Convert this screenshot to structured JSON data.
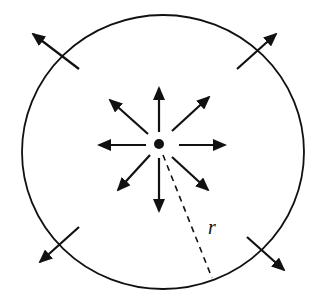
{
  "diagram": {
    "radius_label": "r",
    "colors": {
      "stroke": "#111111",
      "background": "#ffffff"
    },
    "circle": {
      "cx": 163,
      "cy": 152,
      "rx": 141,
      "ry": 137
    },
    "source": {
      "cx": 159,
      "cy": 144,
      "r": 5
    },
    "inner_arrows": [
      {
        "x1": 159,
        "y1": 132,
        "x2": 159,
        "y2": 88
      },
      {
        "x1": 172,
        "y1": 131,
        "x2": 209,
        "y2": 97
      },
      {
        "x1": 179,
        "y1": 145,
        "x2": 225,
        "y2": 145
      },
      {
        "x1": 172,
        "y1": 157,
        "x2": 208,
        "y2": 190
      },
      {
        "x1": 159,
        "y1": 158,
        "x2": 159,
        "y2": 211
      },
      {
        "x1": 150,
        "y1": 155,
        "x2": 118,
        "y2": 190
      },
      {
        "x1": 146,
        "y1": 145,
        "x2": 99,
        "y2": 145
      },
      {
        "x1": 148,
        "y1": 134,
        "x2": 110,
        "y2": 100
      }
    ],
    "outer_arrows": [
      {
        "x1": 79,
        "y1": 69,
        "x2": 33,
        "y2": 34
      },
      {
        "x1": 237,
        "y1": 69,
        "x2": 276,
        "y2": 34
      },
      {
        "x1": 79,
        "y1": 227,
        "x2": 40,
        "y2": 262
      },
      {
        "x1": 247,
        "y1": 237,
        "x2": 284,
        "y2": 270
      }
    ],
    "radius_line": {
      "x1": 163,
      "y1": 155,
      "x2": 212,
      "y2": 278
    },
    "radius_label_pos": {
      "x": 208,
      "y": 234
    }
  }
}
